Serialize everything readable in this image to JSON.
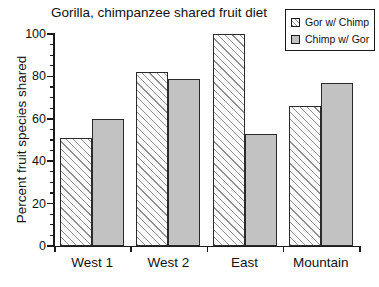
{
  "chart_data": {
    "type": "bar",
    "title": "Gorilla, chimpanzee shared fruit diet",
    "xlabel": "",
    "ylabel": "Percent fruit species shared",
    "categories": [
      "West 1",
      "West 2",
      "East",
      "Mountain"
    ],
    "series": [
      {
        "name": "Gor w/ Chimp",
        "values": [
          51,
          82,
          100,
          66
        ],
        "fill": "hatched",
        "color": "#fbfbfb"
      },
      {
        "name": "Chimp w/ Gor",
        "values": [
          60,
          79,
          53,
          77
        ],
        "fill": "solid",
        "color": "#c2c2c2"
      }
    ],
    "ylim": [
      0,
      100
    ],
    "y_ticks": [
      0,
      20,
      40,
      60,
      80,
      100
    ],
    "y_minor_tick_step": 5,
    "grid": false,
    "legend_position": "top-right",
    "axis_color": "#1a1a1a",
    "bar_border_color": "#2a2a2a"
  },
  "legend": {
    "entries": [
      {
        "label": "Gor w/ Chimp",
        "swatch": "hatched-swatch-icon"
      },
      {
        "label": "Chimp w/ Gor",
        "swatch": "solid-gray-swatch-icon"
      }
    ]
  },
  "axes": {
    "y_title": "Percent fruit species shared",
    "y_tick_labels": [
      "100",
      "80",
      "60",
      "40",
      "20",
      "0"
    ],
    "x_tick_labels": [
      "West 1",
      "West 2",
      "East",
      "Mountain"
    ]
  },
  "title": "Gorilla, chimpanzee shared fruit diet"
}
